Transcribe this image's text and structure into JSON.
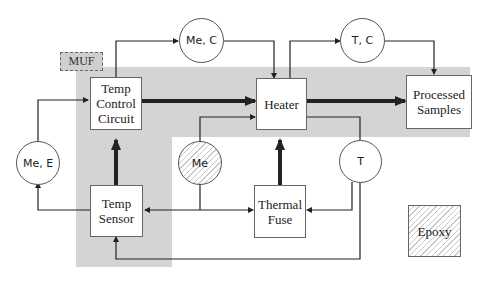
{
  "diagram": {
    "labels": {
      "muf": "MUF",
      "temp_control_circuit": "Temp\nControl\nCircuit",
      "heater": "Heater",
      "processed_samples": "Processed\nSamples",
      "temp_sensor": "Temp\nSensor",
      "thermal_fuse": "Thermal\nFuse",
      "epoxy": "Epoxy",
      "circle_me_c": "Me, C",
      "circle_t_c": "T, C",
      "circle_me_e": "Me, E",
      "circle_me": "Me",
      "circle_t": "T"
    },
    "colors": {
      "shaded_region": "#d4d4d4",
      "line": "#222222",
      "box_border": "#666666",
      "hatch": "#c8c8c8"
    }
  }
}
